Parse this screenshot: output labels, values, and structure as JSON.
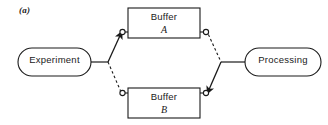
{
  "figure": {
    "panel_label": "(a)",
    "background_color": "#ffffff",
    "stroke_color": "#1a1a1a"
  },
  "nodes": {
    "experiment": {
      "label": "Experiment",
      "shape": "stadium",
      "x": 18,
      "y": 48,
      "width": 73,
      "height": 28
    },
    "processing": {
      "label": "Processing",
      "shape": "stadium",
      "x": 245,
      "y": 48,
      "width": 76,
      "height": 28
    },
    "buffer_a": {
      "label": "Buffer",
      "sublabel": "A",
      "shape": "rect",
      "x": 128,
      "y": 8,
      "width": 72,
      "height": 30
    },
    "buffer_b": {
      "label": "Buffer",
      "sublabel": "B",
      "shape": "rect",
      "x": 128,
      "y": 88,
      "width": 72,
      "height": 30
    }
  },
  "connections": [
    {
      "name": "experiment-to-junction",
      "from": "experiment",
      "to": "input-junction",
      "style": "solid"
    },
    {
      "name": "input-junction-to-buffer-a",
      "from": "input-junction",
      "to": "buffer-a-input-terminal",
      "style": "solid",
      "arrow": true
    },
    {
      "name": "input-junction-to-buffer-b",
      "from": "input-junction",
      "to": "buffer-b-input-terminal",
      "style": "dashed",
      "arrow": false
    },
    {
      "name": "buffer-a-to-output-junction",
      "from": "buffer-a-output-terminal",
      "to": "output-junction",
      "style": "dashed",
      "arrow": false
    },
    {
      "name": "buffer-b-to-output-junction",
      "from": "output-junction",
      "to": "buffer-b-output-terminal",
      "style": "solid",
      "arrow": true
    },
    {
      "name": "output-junction-to-processing",
      "from": "output-junction",
      "to": "processing",
      "style": "solid"
    }
  ],
  "terminals": [
    {
      "name": "buffer-a-input-terminal",
      "x": 122.5,
      "y": 32
    },
    {
      "name": "buffer-a-output-terminal",
      "x": 206,
      "y": 32
    },
    {
      "name": "buffer-b-input-terminal",
      "x": 122.5,
      "y": 93
    },
    {
      "name": "buffer-b-output-terminal",
      "x": 206,
      "y": 93
    }
  ],
  "junctions": [
    {
      "name": "input-junction",
      "x": 108,
      "y": 62
    },
    {
      "name": "output-junction",
      "x": 221,
      "y": 62
    }
  ]
}
